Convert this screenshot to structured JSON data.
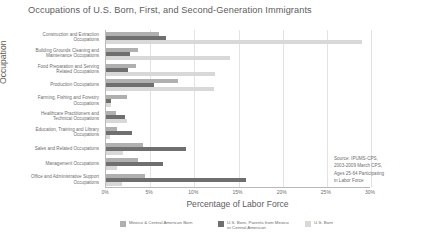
{
  "chart_data": {
    "type": "bar",
    "orientation": "horizontal",
    "title": "Occupations of U.S. Born, First, and Second-Generation Immigrants",
    "xlabel": "Percentage of Labor Force",
    "ylabel": "Occupation",
    "xlim": [
      0,
      30
    ],
    "xticks": [
      0,
      5,
      10,
      15,
      20,
      25,
      30
    ],
    "xticklabels": [
      "0%",
      "5%",
      "10%",
      "15%",
      "20%",
      "25%",
      "30%"
    ],
    "grid": "vertical",
    "legend_position": "bottom",
    "categories": [
      "Construction and Extraction Occupations",
      "Building Grounds Cleaning and Maintenance Occupations",
      "Food Preparation and Serving Related Occupations",
      "Production Occupations",
      "Farming, Fishing and Forestry Occupations",
      "Healthcare Practitioners and Technical Occupations",
      "Education, Training and Library Occupations",
      "Sales and Related Occupations",
      "Management Occupations",
      "Office and Administrative Support Occupations"
    ],
    "series": [
      {
        "name": "Mexico & Central American Born",
        "color": "#b0b0b0",
        "values": [
          6.0,
          3.6,
          3.4,
          8.2,
          2.4,
          1.1,
          1.3,
          4.2,
          3.6,
          4.4
        ]
      },
      {
        "name": "U.S. Born, Parents from Mexico\nor Central American",
        "color": "#6f6f6f",
        "values": [
          6.8,
          2.7,
          2.5,
          5.4,
          0.6,
          2.2,
          2.9,
          9.0,
          6.4,
          15.9
        ]
      },
      {
        "name": "U.S. Born",
        "color": "#d8d8d8",
        "values": [
          29.0,
          14.0,
          12.3,
          12.2,
          0.6,
          2.4,
          0.5,
          1.9,
          1.3,
          1.8
        ]
      }
    ],
    "annotation": "Source: IPUMS-CPS,\n2003-2009 March CPS,\nAges 25-64 Participating\nin Labor Force"
  },
  "legend": [
    {
      "label": "Mexico & Central American Born",
      "color": "#b0b0b0",
      "left": 0,
      "width": 95
    },
    {
      "label": "U.S. Born, Parents from Mexico\nor Central American",
      "color": "#6f6f6f",
      "left": 98,
      "width": 80
    },
    {
      "label": "U.S. Born",
      "color": "#d8d8d8",
      "left": 185,
      "width": 50
    }
  ]
}
